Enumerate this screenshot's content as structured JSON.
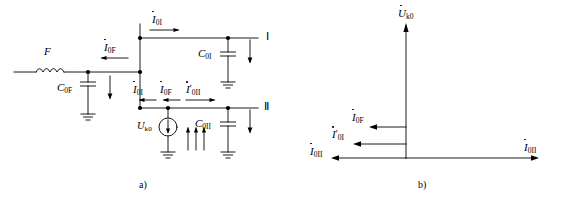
{
  "figure": {
    "panels": [
      {
        "key": "a",
        "caption": "a)",
        "title": "zero-sequence-equivalent-circuit"
      },
      {
        "key": "b",
        "caption": "b)",
        "title": "zero-sequence-phasor-diagram"
      }
    ]
  },
  "circuit": {
    "components": {
      "inductor_f": "F",
      "cap_0f": {
        "base": "C",
        "sub": "0F"
      },
      "cap_0I": {
        "base": "C",
        "sub": "0I"
      },
      "cap_0II": {
        "base": "C",
        "sub": "0II"
      },
      "source": {
        "base": "U",
        "sub": "k0"
      }
    },
    "currents": {
      "i_0F_top": {
        "base": "I",
        "sub": "0F",
        "prime": ""
      },
      "i_0I_top": {
        "base": "I",
        "sub": "0I",
        "prime": ""
      },
      "i_0I_mid": {
        "base": "I",
        "sub": "0I",
        "prime": ""
      },
      "i_0F_mid": {
        "base": "I",
        "sub": "0F",
        "prime": ""
      },
      "i_0II_mid": {
        "base": "I",
        "sub": "0II",
        "prime": "′"
      }
    },
    "terminals": {
      "top": "Ⅰ",
      "bottom": "Ⅱ"
    }
  },
  "phasor": {
    "axis": {
      "base": "U",
      "sub": "k0",
      "prime": ""
    },
    "vectors": [
      {
        "name": "i-0F",
        "base": "I",
        "sub": "0F",
        "prime": "",
        "direction": "left",
        "length": 50
      },
      {
        "name": "i-0I",
        "base": "I",
        "sub": "0I",
        "prime": "′",
        "direction": "left",
        "length": 75
      },
      {
        "name": "i-0II-left",
        "base": "I",
        "sub": "0II",
        "prime": "",
        "direction": "left",
        "length": 120
      },
      {
        "name": "i-0II-right",
        "base": "I",
        "sub": "0II",
        "prime": "",
        "direction": "right",
        "length": 185
      }
    ]
  },
  "colors": {
    "line": "#000000",
    "background": "#ffffff"
  }
}
